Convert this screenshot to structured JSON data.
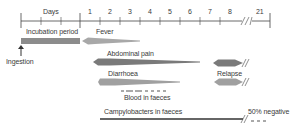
{
  "timeline": {
    "axis_label": "Days",
    "ticks": [
      "1",
      "2",
      "3",
      "4",
      "5",
      "6",
      "7",
      "8",
      "21"
    ]
  },
  "phases": {
    "incubation": "Incubation period",
    "ingestion": "Ingestion",
    "fever": "Fever",
    "abdominal_pain": "Abdominal pain",
    "relapse": "Relapse",
    "diarrhoea": "Diarrhoea",
    "blood": "Blood in faeces",
    "campylobacters": "Campylobacters in faeces",
    "negative": "50% negative"
  },
  "colors": {
    "axis": "#444444",
    "incubation_bar": "#8c8c8c",
    "fever": "#a8a8a8",
    "abdominal_pain": "#7a7a7a",
    "diarrhoea": "#a0a0a0",
    "relapse_pain": "#7a7a7a",
    "relapse_diarrhoea": "#a0a0a0",
    "campylobacter_line": "#333333"
  }
}
